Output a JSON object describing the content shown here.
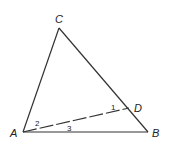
{
  "figure": {
    "points": {
      "A": {
        "label": "A",
        "x": 23,
        "y": 132
      },
      "B": {
        "label": "B",
        "x": 148,
        "y": 132
      },
      "C": {
        "label": "C",
        "x": 59,
        "y": 28
      },
      "D": {
        "label": "D",
        "x": 129,
        "y": 108
      }
    },
    "segments": [
      {
        "from": "A",
        "to": "B",
        "style": "solid"
      },
      {
        "from": "A",
        "to": "C",
        "style": "solid"
      },
      {
        "from": "C",
        "to": "B",
        "style": "solid"
      },
      {
        "from": "A",
        "to": "D",
        "style": "dashed"
      }
    ],
    "angle_labels": {
      "angle1": "1",
      "angle2": "2",
      "angle3": "3"
    },
    "colors": {
      "line": "#333333",
      "background": "#ffffff"
    }
  }
}
